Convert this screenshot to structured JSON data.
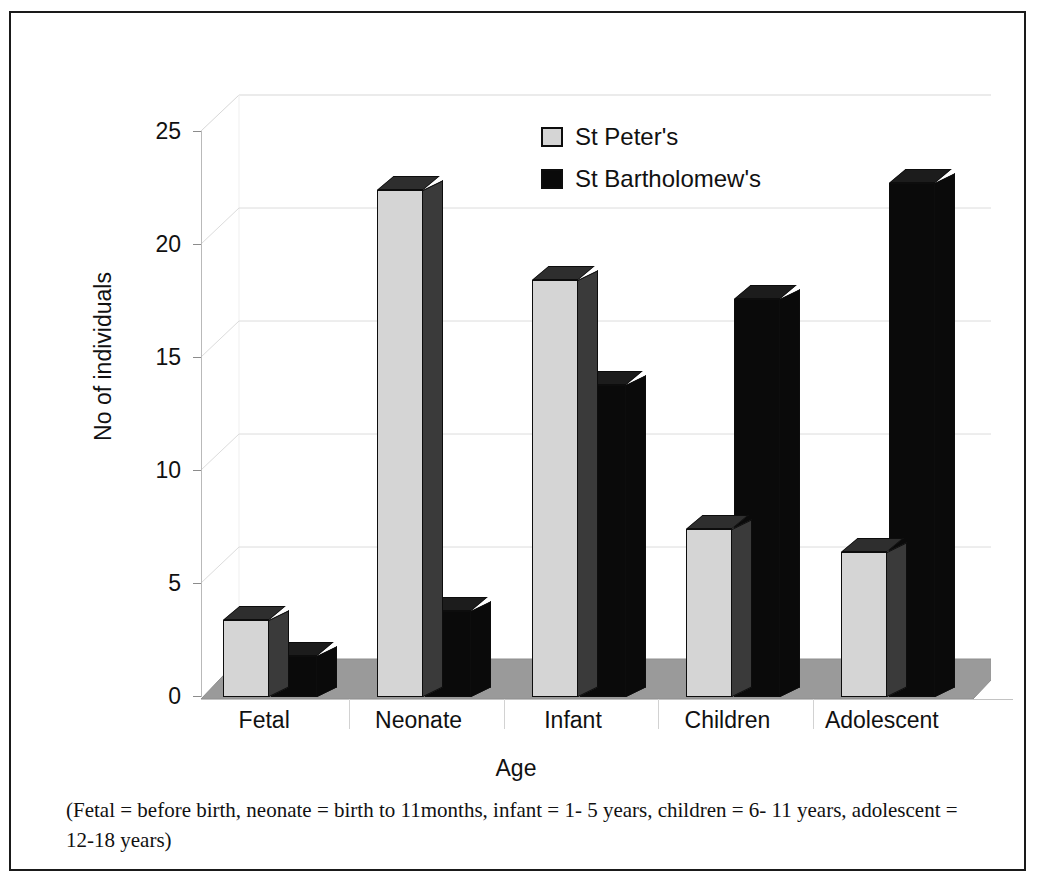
{
  "chart_data": {
    "type": "bar",
    "title": "",
    "xlabel": "Age",
    "ylabel": "No of individuals",
    "categories": [
      "Fetal",
      "Neonate",
      "Infant",
      "Children",
      "Adolescent"
    ],
    "series": [
      {
        "name": "St Peter's",
        "color": "#d5d5d5",
        "values": [
          3.4,
          22.4,
          18.4,
          7.4,
          6.4
        ]
      },
      {
        "name": "St Bartholomew's",
        "color": "#0a0a0a",
        "values": [
          1.8,
          3.8,
          13.8,
          17.6,
          22.7
        ]
      }
    ],
    "ylim": [
      0,
      25
    ],
    "yticks": [
      0,
      5,
      10,
      15,
      20,
      25
    ],
    "ytick_labels": [
      "0",
      "5",
      "10",
      "15",
      "20",
      "25"
    ],
    "grid": true,
    "legend_position": "top-center",
    "style": "3d-clustered-column"
  },
  "legend": {
    "items": [
      {
        "label": "St Peter's",
        "swatch": "#d5d5d5"
      },
      {
        "label": "St Bartholomew's",
        "swatch": "#0a0a0a"
      }
    ]
  },
  "axes": {
    "y_title": "No of individuals",
    "x_title": "Age",
    "y_ticks": [
      "25",
      "20",
      "15",
      "10",
      "5",
      "0"
    ],
    "x_ticks": [
      "Fetal",
      "Neonate",
      "Infant",
      "Children",
      "Adolescent"
    ]
  },
  "caption": {
    "text": "(Fetal = before birth, neonate = birth to 11months, infant = 1- 5 years, children = 6- 11 years, adolescent = 12-18 years)"
  }
}
